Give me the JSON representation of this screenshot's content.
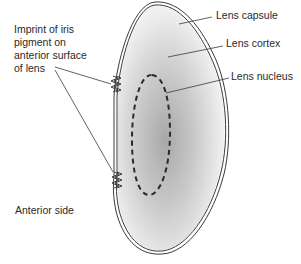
{
  "labels": {
    "lens_capsule": "Lens capsule",
    "lens_cortex": "Lens cortex",
    "lens_nucleus": "Lens nucleus",
    "imprint_line1": "Imprint of iris",
    "imprint_line2": "pigment on",
    "imprint_line3": "anterior surface",
    "imprint_line4": "of lens",
    "anterior_side": "Anterior side"
  },
  "colors": {
    "outline": "#3a3a3a",
    "cortex_light": "#f4f4f4",
    "nucleus_dark": "#9a9a9a",
    "text": "#2a2a2a"
  }
}
